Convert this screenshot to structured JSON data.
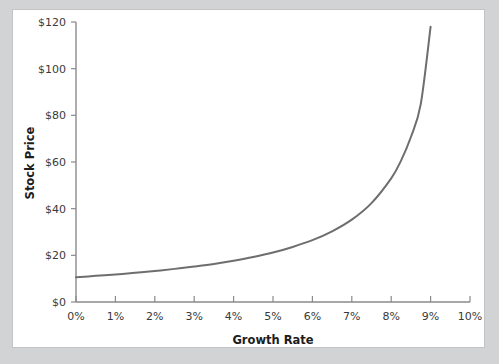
{
  "figure": {
    "background_color": "#d2d3d5",
    "panel_color": "#ffffff",
    "panel_border_color": "#c3c4c6"
  },
  "chart_data": {
    "type": "line",
    "title": "",
    "subtitle": "",
    "xlabel": "Growth Rate",
    "ylabel": "Stock Price",
    "xlim": [
      0,
      10
    ],
    "ylim": [
      0,
      120
    ],
    "xticks": [
      0,
      1,
      2,
      3,
      4,
      5,
      6,
      7,
      8,
      9,
      10
    ],
    "xtick_labels": [
      "0%",
      "1%",
      "2%",
      "3%",
      "4%",
      "5%",
      "6%",
      "7%",
      "8%",
      "9%",
      "10%"
    ],
    "yticks": [
      0,
      20,
      40,
      60,
      80,
      100,
      120
    ],
    "ytick_labels": [
      "$0",
      "$20",
      "$40",
      "$60",
      "$80",
      "$100",
      "$120"
    ],
    "grid": false,
    "legend": false,
    "legend_position": "none",
    "line_color": "#6e6e6e",
    "line_width": 2,
    "series": [
      {
        "name": "Stock Price",
        "x": [
          0,
          0.5,
          1,
          1.5,
          2,
          2.5,
          3,
          3.5,
          4,
          4.5,
          5,
          5.5,
          6,
          6.5,
          7,
          7.5,
          8,
          8.25,
          8.5,
          8.75,
          9
        ],
        "values": [
          10.6,
          11.2,
          11.8,
          12.5,
          13.3,
          14.2,
          15.2,
          16.3,
          17.7,
          19.3,
          21.2,
          23.6,
          26.5,
          30.3,
          35.3,
          42.4,
          53.0,
          60.6,
          70.7,
          84.8,
          118.0
        ]
      }
    ],
    "annotations": []
  },
  "axis": {
    "x_title": "Growth Rate",
    "y_title": "Stock Price"
  }
}
